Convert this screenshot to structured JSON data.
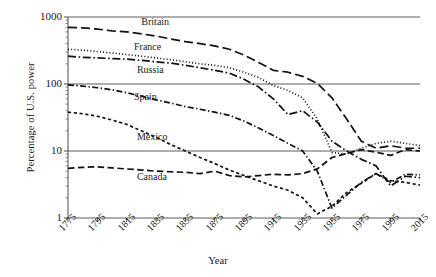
{
  "chart_data": {
    "type": "line",
    "title": "",
    "xlabel": "Year",
    "ylabel": "Percentage of U.S. power",
    "yscale": "log",
    "ylim": [
      1,
      1000
    ],
    "xlim": [
      1775,
      2015
    ],
    "yticks": [
      "1000",
      "100",
      "10",
      "1"
    ],
    "ytick_values": [
      1000,
      100,
      10,
      1
    ],
    "xticks": [
      "1775",
      "1795",
      "1815",
      "1835",
      "1855",
      "1875",
      "1895",
      "1915",
      "1935",
      "1955",
      "1975",
      "1995",
      "2015"
    ],
    "xtick_values": [
      1775,
      1795,
      1815,
      1835,
      1855,
      1875,
      1895,
      1915,
      1935,
      1955,
      1975,
      1995,
      2015
    ],
    "grid": "horizontal-major",
    "legend": "inline-labels",
    "x": [
      1775,
      1785,
      1795,
      1805,
      1815,
      1825,
      1835,
      1845,
      1855,
      1865,
      1875,
      1885,
      1895,
      1905,
      1915,
      1925,
      1935,
      1945,
      1955,
      1965,
      1975,
      1985,
      1995,
      2005,
      2015
    ],
    "series": [
      {
        "name": "Britain",
        "dash": "long-dash",
        "label_x": 1825,
        "label_y": 820,
        "values": [
          700,
          690,
          660,
          620,
          600,
          560,
          520,
          470,
          430,
          400,
          370,
          330,
          270,
          210,
          160,
          150,
          130,
          102,
          62,
          30,
          14,
          11,
          12,
          11,
          11
        ]
      },
      {
        "name": "France",
        "dash": "dotted",
        "label_x": 1820,
        "label_y": 340,
        "values": [
          330,
          320,
          305,
          290,
          275,
          260,
          245,
          230,
          215,
          200,
          190,
          175,
          150,
          125,
          95,
          80,
          62,
          30,
          9.5,
          9,
          11,
          13,
          14,
          13,
          12
        ]
      },
      {
        "name": "Russia",
        "dash": "dash-dot",
        "label_x": 1822,
        "label_y": 155,
        "values": [
          260,
          250,
          245,
          240,
          235,
          225,
          215,
          205,
          190,
          175,
          160,
          145,
          118,
          90,
          60,
          35,
          40,
          27,
          14,
          10,
          7.5,
          6,
          3.0,
          4.2,
          4.0
        ]
      },
      {
        "name": "Spain",
        "dash": "dash-dot-short",
        "label_x": 1820,
        "label_y": 62,
        "values": [
          97,
          93,
          88,
          82,
          74,
          66,
          58,
          52,
          46,
          42,
          38,
          34,
          28,
          22,
          17,
          13,
          10,
          5.0,
          1.4,
          2.2,
          3.4,
          4.6,
          3.4,
          4.5,
          4.4
        ]
      },
      {
        "name": "Mexico",
        "dash": "short-dash",
        "label_x": 1822,
        "label_y": 15.5,
        "values": [
          38,
          36,
          33,
          29,
          25,
          20,
          16,
          12.5,
          10,
          8,
          6.5,
          5.2,
          4.3,
          3.6,
          3.0,
          2.6,
          2.0,
          1.15,
          1.5,
          2.4,
          3.3,
          4.6,
          3.6,
          3.4,
          3.1
        ]
      },
      {
        "name": "Canada",
        "dash": "medium-dash",
        "label_x": 1822,
        "label_y": 4.0,
        "values": [
          5.5,
          5.7,
          5.8,
          5.6,
          5.4,
          5.2,
          5.0,
          4.9,
          4.8,
          4.6,
          5.0,
          4.3,
          4.1,
          4.3,
          4.5,
          4.4,
          4.6,
          5.4,
          8.0,
          9.2,
          10.5,
          9.6,
          8.6,
          10.5,
          10.0
        ]
      }
    ]
  },
  "axis": {
    "y_title": "Percentage of U.S. power",
    "x_title": "Year"
  }
}
